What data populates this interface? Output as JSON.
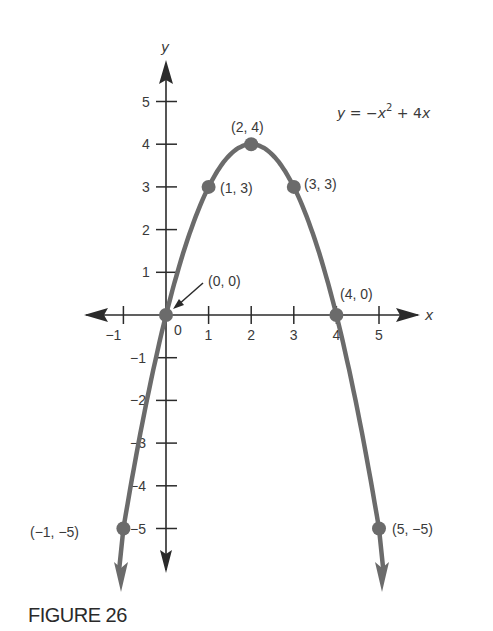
{
  "chart_data": {
    "type": "line",
    "title": "",
    "equation": "y = −x² + 4x",
    "xlabel": "x",
    "ylabel": "y",
    "xlim": [
      -1,
      5
    ],
    "ylim": [
      -5,
      5
    ],
    "x_ticks": [
      -1,
      0,
      1,
      2,
      3,
      4,
      5
    ],
    "x_tick_labels": [
      "−1",
      "0",
      "1",
      "2",
      "3",
      "4",
      "5"
    ],
    "y_ticks": [
      -5,
      -4,
      -3,
      -2,
      -1,
      1,
      2,
      3,
      4,
      5
    ],
    "y_tick_labels": [
      "−5",
      "−4",
      "−3",
      "−2",
      "−1",
      "1",
      "2",
      "3",
      "4",
      "5"
    ],
    "grid": false,
    "series": [
      {
        "name": "y = -x^2 + 4x",
        "x": [
          -1,
          0,
          1,
          2,
          3,
          4,
          5
        ],
        "y": [
          -5,
          0,
          3,
          4,
          3,
          0,
          -5
        ]
      }
    ],
    "points": [
      {
        "x": -1,
        "y": -5,
        "label": "(−1, −5)"
      },
      {
        "x": 0,
        "y": 0,
        "label": "(0, 0)"
      },
      {
        "x": 1,
        "y": 3,
        "label": "(1, 3)"
      },
      {
        "x": 2,
        "y": 4,
        "label": "(2, 4)"
      },
      {
        "x": 3,
        "y": 3,
        "label": "(3, 3)"
      },
      {
        "x": 4,
        "y": 0,
        "label": "(4, 0)"
      },
      {
        "x": 5,
        "y": -5,
        "label": "(5, −5)"
      }
    ],
    "colors": {
      "curve": "#6b6b6b",
      "axis": "#2b2b2b",
      "text": "#3a3a3a"
    }
  },
  "caption": "FIGURE 26"
}
